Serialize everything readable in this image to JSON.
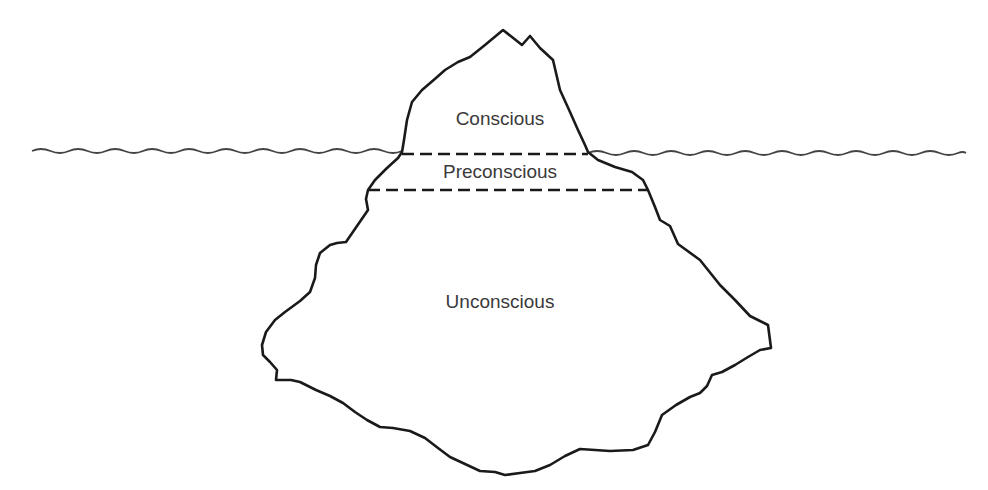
{
  "diagram": {
    "type": "iceberg-model",
    "layers": [
      {
        "id": "conscious",
        "label": "Conscious",
        "position": "above waterline"
      },
      {
        "id": "preconscious",
        "label": "Preconscious",
        "position": "just below waterline"
      },
      {
        "id": "unconscious",
        "label": "Unconscious",
        "position": "deep below waterline"
      }
    ],
    "elements": {
      "waterline": "wavy-line",
      "dividers": [
        "dashed-line-waterline",
        "dashed-line-preconscious-unconscious"
      ]
    },
    "colors": {
      "outline": "#1a1a1a",
      "text": "#3a3a3a",
      "water": "#444444",
      "background": "#ffffff"
    }
  }
}
